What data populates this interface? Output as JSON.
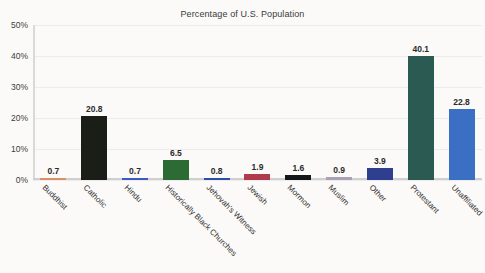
{
  "chart_data": {
    "type": "bar",
    "title": "Percentage of U.S. Population",
    "xlabel": "",
    "ylabel": "",
    "ylim": [
      0,
      50
    ],
    "yticks": [
      "0%",
      "10%",
      "20%",
      "30%",
      "40%",
      "50%"
    ],
    "ytick_values": [
      0,
      10,
      20,
      30,
      40,
      50
    ],
    "grid": true,
    "legend": "none",
    "categories": [
      "Buddhist",
      "Catholic",
      "Hindu",
      "Historically Black Churches",
      "Jehovah's Witness",
      "Jewish",
      "Mormon",
      "Muslim",
      "Other",
      "Protestant",
      "Unaffiliated"
    ],
    "values": [
      0.7,
      20.8,
      0.7,
      6.5,
      0.8,
      1.9,
      1.6,
      0.9,
      3.9,
      40.1,
      22.8
    ],
    "value_labels": [
      "0.7",
      "20.8",
      "0.7",
      "6.5",
      "0.8",
      "1.9",
      "1.6",
      "0.9",
      "3.9",
      "40.1",
      "22.8"
    ],
    "bar_colors": [
      "#d9906a",
      "#1b1d17",
      "#3a5bbf",
      "#2c6b34",
      "#2b4fa8",
      "#b03a4e",
      "#15161a",
      "#a9a2b5",
      "#2e3f8f",
      "#2b5a52",
      "#3a6fc4"
    ]
  },
  "colors": {
    "background": "#fbfaf8",
    "gridline": "#ececec",
    "axis": "#d1d1d1",
    "text": "#2f2f2f"
  }
}
